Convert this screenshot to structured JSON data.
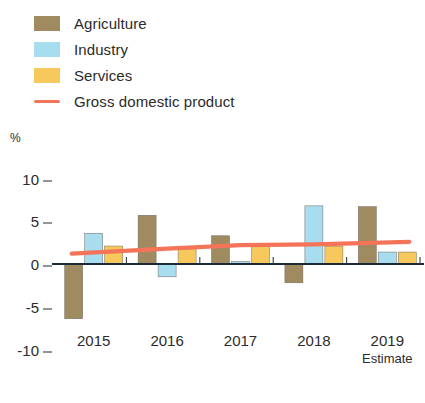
{
  "legend": {
    "items": [
      {
        "label": "Agriculture",
        "marker": "swatch",
        "color": "#a08a5f",
        "name": "legend-agriculture"
      },
      {
        "label": "Industry",
        "marker": "swatch",
        "color": "#a8dcef",
        "name": "legend-industry"
      },
      {
        "label": "Services",
        "marker": "swatch",
        "color": "#f7c95c",
        "name": "legend-services"
      },
      {
        "label": "Gross domestic product",
        "marker": "line",
        "color": "#f4745a",
        "name": "legend-gdp"
      }
    ]
  },
  "axes": {
    "unit": "%",
    "y_ticks": [
      "10",
      "5",
      "0",
      "-5",
      "-10"
    ],
    "x_ticks": [
      "2015",
      "2016",
      "2017",
      "2018",
      "2019"
    ],
    "x_note": "Estimate"
  },
  "chart_data": {
    "type": "bar",
    "title": "",
    "subtitle": "",
    "xlabel": "",
    "ylabel": "%",
    "ylim": [
      -10,
      10
    ],
    "y_ticks": [
      10,
      5,
      0,
      -5,
      -10
    ],
    "grid": false,
    "legend_position": "top-left",
    "categories": [
      "2015",
      "2016",
      "2017",
      "2018",
      "2019"
    ],
    "category_notes": {
      "2019": "Estimate"
    },
    "series": [
      {
        "name": "Agriculture",
        "type": "bar",
        "color": "#a08a5f",
        "values": [
          -6.4,
          5.7,
          3.3,
          -2.2,
          6.7
        ]
      },
      {
        "name": "Industry",
        "type": "bar",
        "color": "#a8dcef",
        "values": [
          3.6,
          -1.5,
          0.3,
          6.8,
          1.4
        ]
      },
      {
        "name": "Services",
        "type": "bar",
        "color": "#f7c95c",
        "values": [
          2.1,
          2.0,
          2.3,
          2.1,
          1.4
        ]
      },
      {
        "name": "Gross domestic product",
        "type": "line",
        "color": "#f4745a",
        "values": [
          1.2,
          1.8,
          2.2,
          2.3,
          2.6
        ]
      }
    ]
  }
}
